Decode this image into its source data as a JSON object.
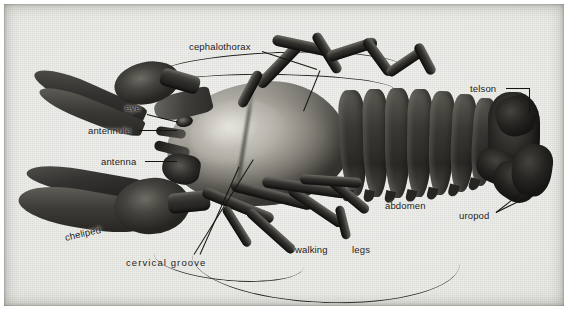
{
  "figure": {
    "plate_background_hex": "#e9e9e6",
    "ink_hex": "#15150f",
    "labels": [
      {
        "id": "cephalothorax",
        "text": "cephalothorax"
      },
      {
        "id": "eye",
        "text": "eye"
      },
      {
        "id": "antennule",
        "text": "antennule"
      },
      {
        "id": "antenna",
        "text": "antenna"
      },
      {
        "id": "cheliped",
        "text": "cheliped"
      },
      {
        "id": "cervical_groove",
        "text": "cervical  groove"
      },
      {
        "id": "walking",
        "text": "walking"
      },
      {
        "id": "legs",
        "text": "legs"
      },
      {
        "id": "abdomen",
        "text": "abdomen"
      },
      {
        "id": "telson",
        "text": "telson"
      },
      {
        "id": "uropod",
        "text": "uropod"
      }
    ]
  }
}
